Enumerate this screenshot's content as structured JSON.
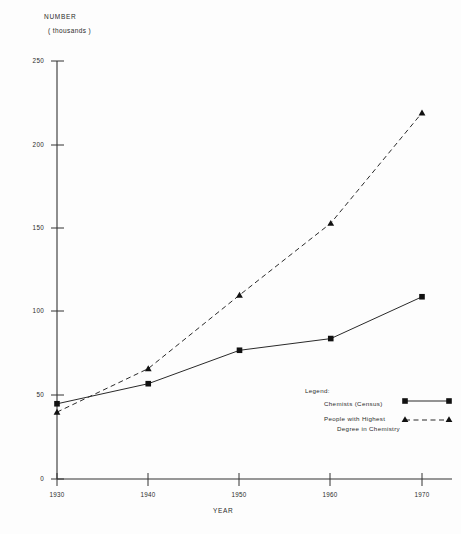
{
  "chart_data": {
    "type": "line",
    "title": "",
    "xlabel": "YEAR",
    "ylabel": "NUMBER",
    "ylabel_units": "( thousands )",
    "x": [
      1930,
      1940,
      1950,
      1960,
      1970
    ],
    "xtick_labels": [
      "1930",
      "1940",
      "1950",
      "1960",
      "1970"
    ],
    "ytick_labels": [
      "0",
      "50",
      "100",
      "150",
      "200",
      "250"
    ],
    "ytick_values": [
      0,
      50,
      100,
      150,
      200,
      250
    ],
    "xlim": [
      1930,
      1970
    ],
    "ylim": [
      0,
      250
    ],
    "grid": false,
    "legend_position": "inside-right",
    "legend_title": "Legend:",
    "series": [
      {
        "name": "Chemists (Census)",
        "label_lines": [
          "Chemists  (Census)"
        ],
        "values": [
          45,
          57,
          77,
          84,
          109
        ],
        "marker": "square",
        "linestyle": "solid",
        "color": "#1a1a1a"
      },
      {
        "name": "People with Highest Degree in Chemistry",
        "label_lines": [
          "People  with  Highest",
          "Degree   in   Chemistry"
        ],
        "values": [
          40,
          66,
          110,
          153,
          219
        ],
        "marker": "triangle",
        "linestyle": "dashed",
        "color": "#1a1a1a"
      }
    ]
  },
  "axes": {
    "y_title": "NUMBER",
    "y_units": "( thousands )",
    "x_title": "YEAR"
  },
  "ticks": {
    "y": [
      {
        "label": "250"
      },
      {
        "label": "200"
      },
      {
        "label": "150"
      },
      {
        "label": "100"
      },
      {
        "label": "50"
      },
      {
        "label": "0"
      }
    ],
    "x": [
      {
        "label": "1930"
      },
      {
        "label": "1940"
      },
      {
        "label": "1950"
      },
      {
        "label": "1960"
      },
      {
        "label": "1970"
      }
    ]
  },
  "legend": {
    "title": "Legend:",
    "item0": "Chemists  (Census)",
    "item1_line1": "People  with  Highest",
    "item1_line2": "Degree   in   Chemistry"
  },
  "colors": {
    "ink": "#1a1a1a",
    "paper": "#fdfdfd"
  }
}
